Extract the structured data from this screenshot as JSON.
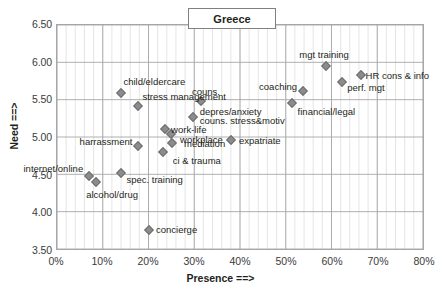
{
  "chart_data": {
    "type": "scatter",
    "title": "Greece",
    "xlabel": "Presence ==>",
    "ylabel": "Need ==>",
    "xlim": [
      0,
      80
    ],
    "ylim": [
      3.5,
      6.5
    ],
    "x_tick_labels": [
      "0%",
      "10%",
      "20%",
      "30%",
      "40%",
      "50%",
      "60%",
      "70%",
      "80%"
    ],
    "x_tick_values": [
      0,
      10,
      20,
      30,
      40,
      50,
      60,
      70,
      80
    ],
    "y_tick_labels": [
      "6.50",
      "6.00",
      "5.50",
      "5.00",
      "4.50",
      "4.00",
      "3.50"
    ],
    "y_tick_values": [
      6.5,
      6.0,
      5.5,
      5.0,
      4.5,
      4.0,
      3.5
    ],
    "x_minor_step": 2,
    "grid": "major-and-minor-vertical-major-horizontal",
    "legend": "none",
    "marker_color": "#8c8c8c",
    "marker_shape": "diamond",
    "points": [
      {
        "label": "internet/online",
        "x": 7.0,
        "y": 4.49,
        "label_anchor": "end",
        "label_dx": -6,
        "label_dy": -7
      },
      {
        "label": "alcohol/drug",
        "x": 8.5,
        "y": 4.42,
        "label_anchor": "mid",
        "label_dx": 16,
        "label_dy": 13
      },
      {
        "label": "spec. training",
        "x": 14.0,
        "y": 4.53,
        "label_anchor": "start",
        "label_dx": 5,
        "label_dy": 7
      },
      {
        "label": "concierge",
        "x": 20.0,
        "y": 3.78,
        "label_anchor": "start",
        "label_dx": 7,
        "label_dy": 0
      },
      {
        "label": "harrassment",
        "x": 17.7,
        "y": 4.89,
        "label_anchor": "end",
        "label_dx": -6,
        "label_dy": -4
      },
      {
        "label": "ci & trauma",
        "x": 23.0,
        "y": 4.82,
        "label_anchor": "start",
        "label_dx": 10,
        "label_dy": 9
      },
      {
        "label": "mediation",
        "x": 25.0,
        "y": 4.93,
        "label_anchor": "start",
        "label_dx": 12,
        "label_dy": 1
      },
      {
        "label": "work-life",
        "x": 23.5,
        "y": 5.12,
        "label_anchor": "start",
        "label_dx": 6,
        "label_dy": 1
      },
      {
        "label": "workplace",
        "x": 24.8,
        "y": 5.05,
        "label_anchor": "start",
        "label_dx": 9,
        "label_dy": 6
      },
      {
        "label": "expatriate",
        "x": 37.8,
        "y": 4.98,
        "label_anchor": "start",
        "label_dx": 8,
        "label_dy": 1
      },
      {
        "label": "couns. stress&motiv",
        "x": 29.5,
        "y": 5.28,
        "label_anchor": "start",
        "label_dx": 7,
        "label_dy": 4
      },
      {
        "label": "depres/anxiety",
        "x": 29.5,
        "y": 5.28,
        "label_anchor": "start",
        "label_dx": 7,
        "label_dy": -5
      },
      {
        "label": "couns.",
        "x": 31.3,
        "y": 5.49,
        "label_anchor": "mid",
        "label_dx": 5,
        "label_dy": -9
      },
      {
        "label": "stress management",
        "x": 17.7,
        "y": 5.42,
        "label_anchor": "start",
        "label_dx": 4,
        "label_dy": -9
      },
      {
        "label": "child/eldercare",
        "x": 14.0,
        "y": 5.6,
        "label_anchor": "start",
        "label_dx": 2,
        "label_dy": -11
      },
      {
        "label": "financial/legal",
        "x": 51.0,
        "y": 5.47,
        "label_anchor": "start",
        "label_dx": 6,
        "label_dy": 9
      },
      {
        "label": "coaching",
        "x": 53.5,
        "y": 5.63,
        "label_anchor": "end",
        "label_dx": -6,
        "label_dy": -4
      },
      {
        "label": "mgt training",
        "x": 58.5,
        "y": 5.95,
        "label_anchor": "mid",
        "label_dx": -2,
        "label_dy": -11
      },
      {
        "label": "perf. mgt",
        "x": 62.0,
        "y": 5.74,
        "label_anchor": "start",
        "label_dx": 5,
        "label_dy": 6
      },
      {
        "label": "HR cons & info",
        "x": 66.0,
        "y": 5.83,
        "label_anchor": "start",
        "label_dx": 5,
        "label_dy": 1
      }
    ]
  }
}
